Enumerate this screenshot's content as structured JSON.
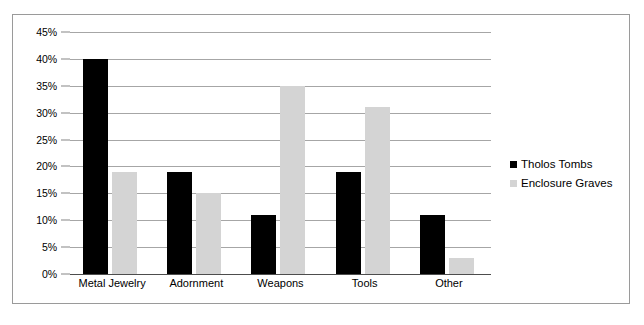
{
  "chart_data": {
    "type": "bar",
    "title": "",
    "subtitle": "",
    "xlabel": "",
    "ylabel": "",
    "categories": [
      "Metal Jewelry",
      "Adornment",
      "Weapons",
      "Tools",
      "Other"
    ],
    "series": [
      {
        "name": "Tholos Tombs",
        "color": "#000000",
        "values": [
          40,
          19,
          11,
          19,
          11
        ]
      },
      {
        "name": "Enclosure Graves",
        "color": "#d4d4d4",
        "values": [
          19,
          15,
          35,
          31,
          3
        ]
      }
    ],
    "ylim": [
      0,
      45
    ],
    "ytick_values": [
      0,
      5,
      10,
      15,
      20,
      25,
      30,
      35,
      40,
      45
    ],
    "ytick_labels": [
      "0%",
      "5%",
      "10%",
      "15%",
      "20%",
      "25%",
      "30%",
      "35%",
      "40%",
      "45%"
    ],
    "grid": true,
    "legend_position": "right",
    "value_suffix": "%"
  },
  "legend": {
    "items": [
      {
        "label": "Tholos Tombs",
        "color": "#000000"
      },
      {
        "label": "Enclosure Graves",
        "color": "#d4d4d4"
      }
    ]
  },
  "caption": {
    "text": ""
  },
  "colors": {
    "series_black": "#000000",
    "series_gray": "#d4d4d4",
    "gridline": "#a6a6a6",
    "axis": "#4d4d4d",
    "frame_border": "#9a9a9a",
    "text": "#000000"
  }
}
